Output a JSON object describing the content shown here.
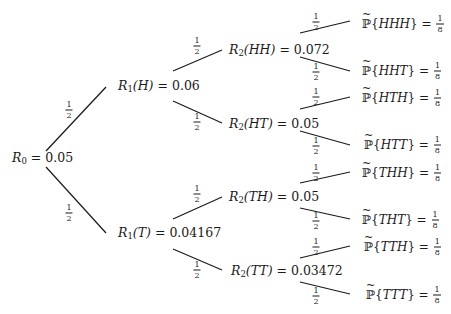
{
  "diagram": {
    "type": "binomial-tree",
    "root": {
      "id": "R0",
      "label": "R",
      "sub": "0",
      "arg": "",
      "value": "0.05"
    },
    "level1": [
      {
        "id": "R1H",
        "label": "R",
        "sub": "1",
        "arg": "(H)",
        "value": "0.06"
      },
      {
        "id": "R1T",
        "label": "R",
        "sub": "1",
        "arg": "(T)",
        "value": "0.04167"
      }
    ],
    "level2": [
      {
        "id": "R2HH",
        "label": "R",
        "sub": "2",
        "arg": "(HH)",
        "value": "0.072"
      },
      {
        "id": "R2HT",
        "label": "R",
        "sub": "2",
        "arg": "(HT)",
        "value": "0.05"
      },
      {
        "id": "R2TH",
        "label": "R",
        "sub": "2",
        "arg": "(TH)",
        "value": "0.05"
      },
      {
        "id": "R2TT",
        "label": "R",
        "sub": "2",
        "arg": "(TT)",
        "value": "0.03472"
      }
    ],
    "leaves": [
      {
        "outcome": "HHH",
        "prob_num": "1",
        "prob_den": "8"
      },
      {
        "outcome": "HHT",
        "prob_num": "1",
        "prob_den": "8"
      },
      {
        "outcome": "HTH",
        "prob_num": "1",
        "prob_den": "8"
      },
      {
        "outcome": "HTT",
        "prob_num": "1",
        "prob_den": "8"
      },
      {
        "outcome": "THH",
        "prob_num": "1",
        "prob_den": "8"
      },
      {
        "outcome": "THT",
        "prob_num": "1",
        "prob_den": "8"
      },
      {
        "outcome": "TTH",
        "prob_num": "1",
        "prob_den": "8"
      },
      {
        "outcome": "TTT",
        "prob_num": "1",
        "prob_den": "8"
      }
    ],
    "edge_prob": {
      "num": "1",
      "den": "2"
    },
    "measure_symbol": "ℙ",
    "equals": "=",
    "line_color": "#1a1a1a"
  }
}
